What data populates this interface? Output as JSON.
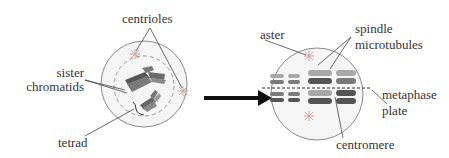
{
  "diagram": {
    "left_cell": {
      "labels": {
        "centrioles": "centrioles",
        "sister_line1": "sister",
        "sister_line2": "chromatids",
        "tetrad": "tetrad"
      }
    },
    "right_cell": {
      "labels": {
        "aster": "aster",
        "spindle_line1": "spindle",
        "spindle_line2": "microtubules",
        "metaphase_line1": "metaphase",
        "metaphase_line2": "plate",
        "centromere": "centromere"
      }
    },
    "colors": {
      "cell_outline": "#8a8a8a",
      "cell_fill": "#f4f4f4",
      "chromosome_dark": "#555555",
      "chromosome_mid": "#7a7a7a",
      "chromosome_light": "#a8a8a8",
      "aster": "#c9a3a3",
      "arrow": "#111111",
      "leader_line": "#444444"
    }
  }
}
